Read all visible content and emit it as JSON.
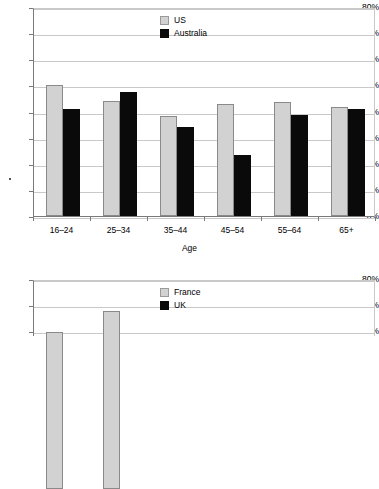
{
  "charts": [
    {
      "id": "chart-internet-use-by-age-us-australia",
      "legend": [
        {
          "name": "US",
          "color": "#d2d2d2"
        },
        {
          "name": "Australia",
          "color": "#0a0a0a"
        }
      ],
      "axis": {
        "xlabel": "Age",
        "yticks": [
          "80%",
          "70%",
          "60%",
          "50%",
          "40%",
          "30%",
          "20%",
          "10%",
          "0%"
        ]
      },
      "chart_data": {
        "type": "bar",
        "title": "",
        "xlabel": "Age",
        "ylabel": "",
        "ylim": [
          0,
          80
        ],
        "ytick_values": [
          0,
          10,
          20,
          30,
          40,
          50,
          60,
          70,
          80
        ],
        "ytick_format": "percent",
        "grid": true,
        "legend_position": "inside-top-center",
        "categories": [
          "16–24",
          "25–34",
          "35–44",
          "45–54",
          "55–64",
          "65+"
        ],
        "series": [
          {
            "name": "US",
            "color": "#d2d2d2",
            "values": [
              50.0,
              44.2,
              38.3,
              42.7,
              43.5,
              41.6
            ]
          },
          {
            "name": "Australia",
            "color": "#0a0a0a",
            "values": [
              40.9,
              47.3,
              34.1,
              23.2,
              38.7,
              40.9
            ]
          }
        ],
        "annotations": [
          {
            "type": "stray-dot-artifact",
            "near": "y-axis between 20% and 10%"
          }
        ]
      }
    },
    {
      "id": "chart-internet-use-by-age-france-uk",
      "cropped": true,
      "legend": [
        {
          "name": "France",
          "color": "#d2d2d2"
        },
        {
          "name": "UK",
          "color": "#0a0a0a"
        }
      ],
      "axis": {
        "xlabel": "",
        "yticks": [
          "80%",
          "70%",
          "60%"
        ]
      },
      "chart_data": {
        "type": "bar",
        "title": "",
        "xlabel": "",
        "ylabel": "",
        "ylim": [
          0,
          80
        ],
        "ytick_values": [
          60,
          70,
          80
        ],
        "ytick_format": "percent",
        "grid": true,
        "legend_position": "inside-top-center",
        "note": "Chart is cut off by the bottom edge of the screenshot; only the top of the plot is visible.",
        "categories": [],
        "series": [
          {
            "name": "France",
            "color": "#d2d2d2",
            "values": [
              60.0,
              68.2
            ]
          },
          {
            "name": "UK",
            "color": "#0a0a0a",
            "values": []
          }
        ]
      }
    }
  ]
}
